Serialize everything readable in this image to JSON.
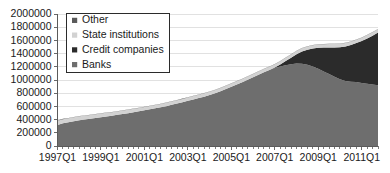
{
  "chart_data": {
    "type": "area",
    "stacked": true,
    "title": "",
    "subtitle": "",
    "xlabel": "",
    "ylabel": "",
    "ylim": [
      0,
      2000000
    ],
    "ytick_step": 200000,
    "grid": true,
    "legend_position": "top-left",
    "ytick_labels": [
      "2000000",
      "1800000",
      "1600000",
      "1400000",
      "1200000",
      "1000000",
      "800000",
      "600000",
      "400000",
      "200000",
      "0"
    ],
    "ytick_values": [
      2000000,
      1800000,
      1600000,
      1400000,
      1200000,
      1000000,
      800000,
      600000,
      400000,
      200000,
      0
    ],
    "xtick_labels": [
      "1997Q1",
      "1999Q1",
      "2001Q1",
      "2003Q1",
      "2005Q1",
      "2007Q1",
      "2009Q1",
      "2011Q1"
    ],
    "xtick_indices": [
      0,
      8,
      16,
      24,
      32,
      40,
      48,
      56
    ],
    "x": [
      "1997Q1",
      "1997Q2",
      "1997Q3",
      "1997Q4",
      "1998Q1",
      "1998Q2",
      "1998Q3",
      "1998Q4",
      "1999Q1",
      "1999Q2",
      "1999Q3",
      "1999Q4",
      "2000Q1",
      "2000Q2",
      "2000Q3",
      "2000Q4",
      "2001Q1",
      "2001Q2",
      "2001Q3",
      "2001Q4",
      "2002Q1",
      "2002Q2",
      "2002Q3",
      "2002Q4",
      "2003Q1",
      "2003Q2",
      "2003Q3",
      "2003Q4",
      "2004Q1",
      "2004Q2",
      "2004Q3",
      "2004Q4",
      "2005Q1",
      "2005Q2",
      "2005Q3",
      "2005Q4",
      "2006Q1",
      "2006Q2",
      "2006Q3",
      "2006Q4",
      "2007Q1",
      "2007Q2",
      "2007Q3",
      "2007Q4",
      "2008Q1",
      "2008Q2",
      "2008Q3",
      "2008Q4",
      "2009Q1",
      "2009Q2",
      "2009Q3",
      "2009Q4",
      "2010Q1",
      "2010Q2",
      "2010Q3",
      "2010Q4",
      "2011Q1",
      "2011Q2",
      "2011Q3",
      "2011Q4"
    ],
    "series": [
      {
        "name": "Banks",
        "color": "#6e6e6e",
        "values": [
          320000,
          345000,
          360000,
          375000,
          390000,
          400000,
          412000,
          424000,
          436000,
          448000,
          460000,
          472000,
          484000,
          498000,
          512000,
          526000,
          540000,
          556000,
          572000,
          588000,
          604000,
          624000,
          644000,
          664000,
          684000,
          706000,
          726000,
          748000,
          772000,
          800000,
          830000,
          862000,
          896000,
          930000,
          966000,
          1002000,
          1040000,
          1080000,
          1116000,
          1150000,
          1180000,
          1205000,
          1225000,
          1240000,
          1250000,
          1245000,
          1230000,
          1205000,
          1170000,
          1130000,
          1090000,
          1050000,
          1010000,
          985000,
          975000,
          968000,
          955000,
          945000,
          932000,
          920000
        ]
      },
      {
        "name": "Credit companies",
        "color": "#2b2b2b",
        "values": [
          0,
          0,
          0,
          0,
          0,
          0,
          0,
          0,
          0,
          0,
          0,
          0,
          0,
          0,
          0,
          0,
          0,
          0,
          0,
          0,
          0,
          0,
          0,
          0,
          0,
          0,
          0,
          0,
          0,
          0,
          0,
          0,
          0,
          0,
          0,
          0,
          0,
          0,
          0,
          0,
          8000,
          30000,
          62000,
          98000,
          140000,
          185000,
          228000,
          272000,
          318000,
          362000,
          404000,
          444000,
          488000,
          524000,
          556000,
          592000,
          635000,
          685000,
          740000,
          800000
        ]
      },
      {
        "name": "State institutions",
        "color": "#d2d2d2",
        "values": [
          62000,
          62000,
          62000,
          62000,
          60000,
          58000,
          57000,
          56000,
          55000,
          54000,
          53000,
          52000,
          52000,
          52000,
          51000,
          51000,
          50000,
          50000,
          50000,
          50000,
          50000,
          50000,
          50000,
          50000,
          50000,
          50000,
          50000,
          50000,
          50000,
          50000,
          50000,
          50000,
          50000,
          50000,
          50000,
          50000,
          50000,
          50000,
          50000,
          50000,
          50000,
          50000,
          50000,
          50000,
          50000,
          50000,
          50000,
          50000,
          50000,
          50000,
          50000,
          50000,
          50000,
          50000,
          50000,
          50000,
          50000,
          50000,
          50000,
          50000
        ]
      },
      {
        "name": "Other",
        "color": "#5a5a5a",
        "values": [
          4000,
          4000,
          4000,
          4000,
          4000,
          4000,
          4000,
          4000,
          4000,
          4000,
          4000,
          4000,
          4000,
          4000,
          4000,
          4000,
          4000,
          4000,
          4000,
          4000,
          4000,
          4000,
          4000,
          4000,
          4000,
          4000,
          4000,
          4000,
          4000,
          4000,
          4000,
          4000,
          4000,
          4000,
          4000,
          4000,
          4000,
          4000,
          4000,
          4000,
          4000,
          4000,
          4000,
          4000,
          4000,
          4000,
          4000,
          4000,
          4000,
          4000,
          4000,
          4000,
          4000,
          4000,
          4000,
          4000,
          4000,
          4000,
          4000,
          4000
        ]
      }
    ],
    "legend_entries": [
      {
        "label": "Other",
        "color": "#5a5a5a"
      },
      {
        "label": "State institutions",
        "color": "#d2d2d2"
      },
      {
        "label": "Credit companies",
        "color": "#2b2b2b"
      },
      {
        "label": "Banks",
        "color": "#6e6e6e"
      }
    ]
  },
  "colors": {
    "background": "#ffffff",
    "axis": "#5a5a5a",
    "grid": "#d9d9d9",
    "text": "#1a1a1a",
    "legend_border": "#2b2b2b"
  }
}
